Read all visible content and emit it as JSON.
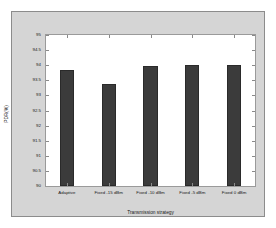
{
  "chart_data": {
    "type": "bar",
    "title": "",
    "categories": [
      "Adaptive",
      "Fixed -15 dBm",
      "Fixed -10 dBm",
      "Fixed -5 dBm",
      "Fixed 0 dBm"
    ],
    "values": [
      93.85,
      93.38,
      93.97,
      94.0,
      94.01
    ],
    "xlabel": "Transmission strategy",
    "ylabel": "PDR(%)",
    "ylim": [
      90,
      95
    ],
    "yticks": [
      90,
      90.5,
      91,
      91.5,
      92,
      92.5,
      93,
      93.5,
      94,
      94.5,
      95
    ],
    "ytick_labels": [
      "90",
      "90.5",
      "91",
      "91.5",
      "92",
      "92.5",
      "93",
      "93.5",
      "94",
      "94.5",
      "95"
    ],
    "grid": false,
    "legend": null,
    "bar_color": "#3b3b3b",
    "plot_background": "#ffffff",
    "figure_background": "#d5d5d5"
  }
}
